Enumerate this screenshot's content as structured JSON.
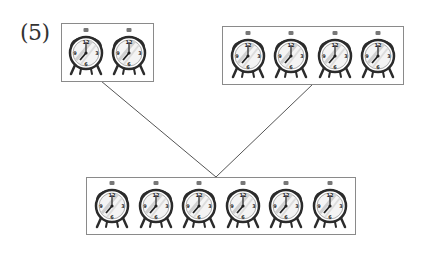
{
  "problem": {
    "label": "(5)"
  },
  "groups": {
    "top_left": {
      "clock_count": 2
    },
    "top_right": {
      "clock_count": 4
    },
    "bottom": {
      "clock_count": 6
    }
  },
  "clock": {
    "icon": "alarm-clock-icon",
    "numerals": [
      "12",
      "3",
      "6",
      "9"
    ],
    "time_shown": "7:00"
  },
  "colors": {
    "border": "#8a8a8a",
    "connector": "#555555",
    "clock_dark": "#2b2b2b",
    "clock_face": "#ffffff"
  }
}
